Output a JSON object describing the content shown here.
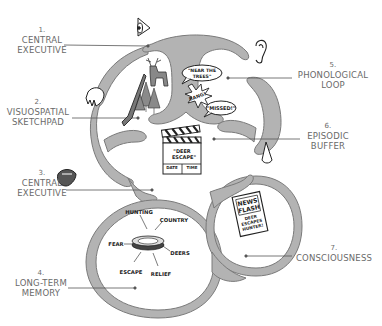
{
  "diagram": {
    "title": "",
    "labels": [
      {
        "id": "1",
        "num": "1.",
        "lines": [
          "CENTRAL",
          "EXECUTIVE"
        ]
      },
      {
        "id": "2",
        "num": "2.",
        "lines": [
          "VISUOSPATIAL",
          "SKETCHPAD"
        ]
      },
      {
        "id": "3",
        "num": "3.",
        "lines": [
          "CENTRAL",
          "EXECUTIVE"
        ]
      },
      {
        "id": "4",
        "num": "4.",
        "lines": [
          "LONG-TERM",
          "MEMORY"
        ]
      },
      {
        "id": "5",
        "num": "5.",
        "lines": [
          "PHONOLOGICAL",
          "LOOP"
        ]
      },
      {
        "id": "6",
        "num": "6.",
        "lines": [
          "EPISODIC",
          "BUFFER"
        ]
      },
      {
        "id": "7",
        "num": "7.",
        "lines": [
          "CONSCIOUSNESS"
        ]
      }
    ],
    "speech_bubbles": [
      {
        "lines": [
          "\"NEAR THE",
          "TREES\""
        ]
      },
      {
        "lines": [
          "BANG!"
        ]
      },
      {
        "lines": [
          "\"MISSED!\""
        ]
      }
    ],
    "clapperboard": {
      "title_lines": [
        "\"DEER",
        "ESCAPE\""
      ],
      "footer": [
        "DATE",
        "TIME"
      ]
    },
    "memory_wheel": {
      "words": [
        "HUNTING",
        "COUNTRY",
        "FEAR",
        "DEERS",
        "ESCAPE",
        "RELIEF"
      ]
    },
    "newspaper": {
      "headline_lines": [
        "NEWS",
        "FLASH"
      ],
      "body_lines": [
        "DEER",
        "ESCAPES",
        "HUNTER!"
      ]
    },
    "sense_icons": [
      "eye-icon",
      "ear-icon",
      "hand-icon",
      "nose-icon",
      "tongue-icon"
    ],
    "colors": {
      "channel_fill": "#b3b3b3",
      "channel_stroke": "#7a7a7a",
      "label_text": "#6a6a6a",
      "leader_line": "#555555",
      "ink": "#222222",
      "tree_fill": "#8a8a8a"
    }
  }
}
